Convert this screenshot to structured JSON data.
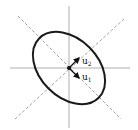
{
  "diagram": {
    "type": "ellipse-principal-axes",
    "center": [
      69,
      68
    ],
    "ellipse": {
      "rx": 42,
      "ry": 29,
      "rotation_deg": 45
    },
    "vectors": [
      {
        "name": "u1",
        "label_main": "u",
        "label_sub": "1",
        "direction": "lower-right"
      },
      {
        "name": "u2",
        "label_main": "u",
        "label_sub": "2",
        "direction": "upper-right"
      }
    ],
    "colors": {
      "ellipse": "#1a1a1a",
      "axes": "#9a9a9a",
      "principal_axes": "#8a8a8a"
    }
  }
}
